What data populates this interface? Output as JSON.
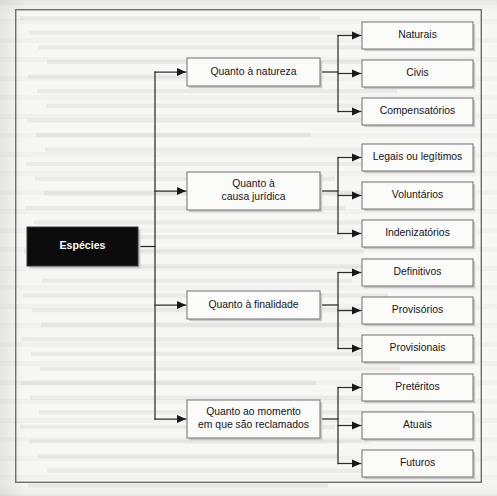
{
  "figure": {
    "kind": "tree-diagram",
    "orientation": "left-to-right",
    "frame": {
      "x": 15,
      "y": 9,
      "width": 467,
      "height": 474
    },
    "canvas": {
      "width": 497,
      "height": 496
    }
  },
  "colors": {
    "page_background": "#f7f7f5",
    "frame_stroke": "#6e6e70",
    "box_fill": "#fbfbfa",
    "box_stroke": "#7c7c7e",
    "box_shadow": "#c9c8c6",
    "root_fill": "#0b0b0c",
    "root_text": "#ffffff",
    "node_text": "#16161a",
    "connector": "#2e2e30"
  },
  "root": {
    "id": "especies",
    "label": "Espécies",
    "box": {
      "x": 27,
      "y": 227,
      "width": 111,
      "height": 39
    }
  },
  "branches": [
    {
      "id": "quanto-a-natureza",
      "label": "Quanto à natureza",
      "lines": [
        "Quanto à natureza"
      ],
      "box": {
        "x": 187,
        "y": 58,
        "width": 133,
        "height": 28
      },
      "children": [
        {
          "id": "naturais",
          "label": "Naturais",
          "box": {
            "x": 362,
            "y": 22,
            "width": 111,
            "height": 27
          }
        },
        {
          "id": "civis",
          "label": "Civis",
          "box": {
            "x": 362,
            "y": 60,
            "width": 111,
            "height": 27
          }
        },
        {
          "id": "compensatorios",
          "label": "Compensatórios",
          "box": {
            "x": 362,
            "y": 98,
            "width": 111,
            "height": 27
          }
        }
      ]
    },
    {
      "id": "quanto-a-causa-juridica",
      "label": "Quanto à causa jurídica",
      "lines": [
        "Quanto à",
        "causa jurídica"
      ],
      "box": {
        "x": 187,
        "y": 172,
        "width": 133,
        "height": 38
      },
      "children": [
        {
          "id": "legais-ou-legitimos",
          "label": "Legais ou legítimos",
          "box": {
            "x": 362,
            "y": 144,
            "width": 111,
            "height": 27
          }
        },
        {
          "id": "voluntarios",
          "label": "Voluntários",
          "box": {
            "x": 362,
            "y": 182,
            "width": 111,
            "height": 27
          }
        },
        {
          "id": "indenizatorios",
          "label": "Indenizatórios",
          "box": {
            "x": 362,
            "y": 220,
            "width": 111,
            "height": 27
          }
        }
      ]
    },
    {
      "id": "quanto-a-finalidade",
      "label": "Quanto à finalidade",
      "lines": [
        "Quanto à finalidade"
      ],
      "box": {
        "x": 187,
        "y": 291,
        "width": 133,
        "height": 28
      },
      "children": [
        {
          "id": "definitivos",
          "label": "Definitivos",
          "box": {
            "x": 362,
            "y": 259,
            "width": 111,
            "height": 27
          }
        },
        {
          "id": "provisorios",
          "label": "Provisórios",
          "box": {
            "x": 362,
            "y": 297,
            "width": 111,
            "height": 27
          }
        },
        {
          "id": "provisionais",
          "label": "Provisionais",
          "box": {
            "x": 362,
            "y": 335,
            "width": 111,
            "height": 27
          }
        }
      ]
    },
    {
      "id": "quanto-ao-momento",
      "label": "Quanto ao momento em que são reclamados",
      "lines": [
        "Quanto ao momento",
        "em que são reclamados"
      ],
      "box": {
        "x": 187,
        "y": 400,
        "width": 133,
        "height": 38
      },
      "children": [
        {
          "id": "preteritos",
          "label": "Pretéritos",
          "box": {
            "x": 362,
            "y": 374,
            "width": 111,
            "height": 27
          }
        },
        {
          "id": "atuais",
          "label": "Atuais",
          "box": {
            "x": 362,
            "y": 412,
            "width": 111,
            "height": 27
          }
        },
        {
          "id": "futuros",
          "label": "Futuros",
          "box": {
            "x": 362,
            "y": 450,
            "width": 111,
            "height": 27
          }
        }
      ]
    }
  ],
  "connectors": {
    "root_trunk_x": 155,
    "branch_trunk_x": 338,
    "arrow_length": 9
  }
}
